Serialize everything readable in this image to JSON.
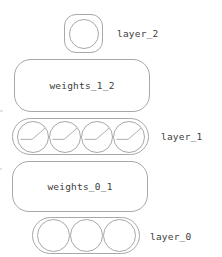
{
  "diagram": {
    "orientation": "bottom-to-top",
    "stroke_color": "#a8a8a8",
    "text_color": "#3c3c3c",
    "background_color": "#ffffff",
    "layers": [
      {
        "id": "layer_2",
        "label": "layer_2",
        "kind": "layer",
        "neuron_count": 1,
        "neuron_glyph": "empty-circle"
      },
      {
        "id": "weights_1_2",
        "label": "weights_1_2",
        "kind": "weights"
      },
      {
        "id": "layer_1",
        "label": "layer_1",
        "kind": "layer",
        "neuron_count": 4,
        "neuron_glyph": "relu-activation-curve"
      },
      {
        "id": "weights_0_1",
        "label": "weights_0_1",
        "kind": "weights"
      },
      {
        "id": "layer_0",
        "label": "layer_0",
        "kind": "layer",
        "neuron_count": 3,
        "neuron_glyph": "empty-circle"
      }
    ]
  }
}
